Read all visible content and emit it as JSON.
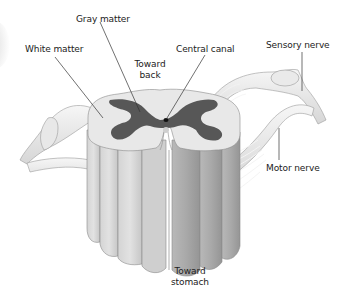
{
  "diagram": {
    "labels": {
      "gray_matter": "Gray matter",
      "white_matter": "White matter",
      "toward_back_1": "Toward",
      "toward_back_2": "back",
      "central_canal": "Central canal",
      "sensory_nerve": "Sensory nerve",
      "motor_nerve": "Motor nerve",
      "toward_stomach_1": "Toward",
      "toward_stomach_2": "stomach"
    },
    "colors": {
      "white_matter": "#e6e6e6",
      "gray_matter": "#555555",
      "column_light": "#d9d9d9",
      "column_dark": "#a8a8a8",
      "nerve": "#eeeeee",
      "leader_line": "#333333",
      "text": "#222222"
    }
  }
}
